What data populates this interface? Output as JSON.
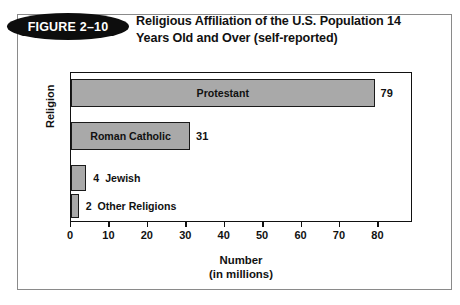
{
  "figure": {
    "badge_label": "FIGURE 2–10",
    "title_line1": "Religious Affiliation of the U.S. Population 14",
    "title_line2": "Years Old and Over (self-reported)"
  },
  "chart_data": {
    "type": "bar",
    "orientation": "horizontal",
    "title": "Religious Affiliation of the U.S. Population 14 Years Old and Over (self-reported)",
    "categories": [
      "Protestant",
      "Roman Catholic",
      "Jewish",
      "Other Religions"
    ],
    "values": [
      79,
      31,
      4,
      2
    ],
    "value_labels": [
      "79",
      "31",
      "4",
      "2"
    ],
    "label_placement": [
      "inside",
      "inside",
      "outside",
      "outside"
    ],
    "xlabel_line1": "Number",
    "xlabel_line2": "(in millions)",
    "ylabel": "Religion",
    "xlim": [
      0,
      89
    ],
    "xticks": [
      0,
      10,
      20,
      30,
      40,
      50,
      60,
      70,
      80
    ],
    "xtick_labels": [
      "0",
      "10",
      "20",
      "30",
      "40",
      "50",
      "60",
      "70",
      "80"
    ],
    "grid": false,
    "legend": false,
    "bar_color": "#a9a9a9",
    "bar_border_color": "#1a1a1a",
    "axis_color": "#111111"
  }
}
